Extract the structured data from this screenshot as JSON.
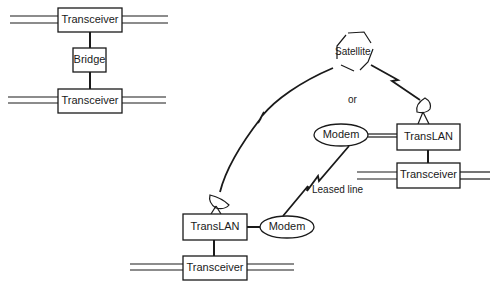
{
  "left_config": {
    "top_transceiver": "Transceiver",
    "bridge": "Bridge",
    "bottom_transceiver": "Transceiver"
  },
  "right_config": {
    "satellite": "Satellite",
    "or_label": "or",
    "remote_site": {
      "modem": "Modem",
      "translan": "TransLAN",
      "transceiver": "Transceiver"
    },
    "local_site": {
      "translan": "TransLAN",
      "modem": "Modem",
      "transceiver": "Transceiver"
    },
    "leased_line_label": "Leased line"
  },
  "colors": {
    "stroke": "#1a1a1a",
    "background": "#ffffff"
  }
}
